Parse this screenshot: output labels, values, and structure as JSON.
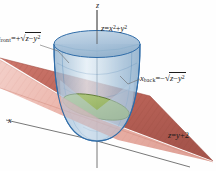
{
  "figure": {
    "kind": "3d-calculus-diagram",
    "background_color": "#fefefe"
  },
  "axes": {
    "z_label": "z",
    "x_label": "x",
    "origin": {
      "x": 97,
      "y": 141
    },
    "z_tip": {
      "x": 97,
      "y": 10
    },
    "x_tip": {
      "x": 6,
      "y": 120
    },
    "y_tip": {
      "x": 188,
      "y": 166
    },
    "axis_color": "#555555"
  },
  "labels": {
    "surface": {
      "name": "paraboloid-equation",
      "lhs": "z",
      "eq": "=",
      "rhs_base1": "x",
      "rhs_exp1": "2",
      "rhs_op": "+",
      "rhs_base2": "y",
      "rhs_exp2": "2",
      "full_text": "z = x² + y²"
    },
    "plane": {
      "name": "plane-equation",
      "lhs": "z",
      "eq": "=",
      "rhs": "y",
      "op": "+",
      "constant": "2",
      "full_text": "z = y + 2"
    },
    "x_front": {
      "name": "x-front-equation",
      "var": "x",
      "sub": "front",
      "eq": "=",
      "sign": "+",
      "radicand_base": "z",
      "radicand_op": "−",
      "radicand_var": "y",
      "radicand_exp": "2",
      "full_text": "x_front = +√(z − y²)"
    },
    "x_back": {
      "name": "x-back-equation",
      "var": "x",
      "sub": "back",
      "eq": "=",
      "sign": "−",
      "radicand_base": "z",
      "radicand_op": "−",
      "radicand_var": "y",
      "radicand_exp": "2",
      "full_text": "x_back = −√(z − y²)"
    }
  },
  "colors": {
    "paraboloid_fill": "#a9c3dc",
    "paraboloid_fill_light": "#cfe0ee",
    "paraboloid_top_fill": "#b3cade",
    "paraboloid_edge": "#2f6ca8",
    "plane_near_fill": "#e9a79c",
    "plane_far_fill": "#b25348",
    "plane_edge": "#9c4a40",
    "ellipse_fill": "#9bb96a",
    "ellipse_edge": "#5d7a33",
    "axis": "#555555",
    "text": "#1a1a1a",
    "leader": "#666666"
  },
  "elements": {
    "paraboloid": {
      "name": "paraboloid-surface",
      "vertex": {
        "x": 97,
        "y": 141
      },
      "top_center": {
        "x": 97,
        "y": 44
      },
      "top_rx": 43,
      "top_ry": 13
    },
    "plane": {
      "name": "cutting-plane"
    },
    "intersection": {
      "name": "intersection-ellipse",
      "center": {
        "x": 96,
        "y": 107
      },
      "rx": 34,
      "ry": 11,
      "rotation_deg": 13
    },
    "leader_front": {
      "name": "leader-line-front"
    },
    "leader_back": {
      "name": "leader-line-back"
    }
  }
}
